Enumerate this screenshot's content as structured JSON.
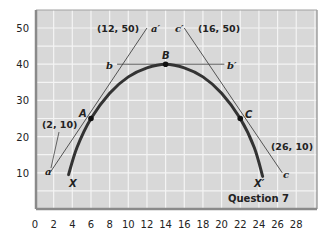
{
  "chart_data": {
    "type": "line",
    "title": "Question 7",
    "xlabel": "",
    "ylabel": "",
    "xlim": [
      0,
      30
    ],
    "ylim": [
      0,
      55
    ],
    "x_ticks": [
      0,
      2,
      4,
      6,
      8,
      10,
      12,
      14,
      16,
      18,
      20,
      22,
      24,
      26,
      28
    ],
    "y_ticks": [
      10,
      20,
      30,
      40,
      50
    ],
    "grid": true,
    "colors": {
      "plot_bg": "#d8d8d8",
      "grid": "#f4f4f4",
      "frame": "#8a8a8a",
      "curve": "#333333",
      "line": "#444444"
    },
    "series": [
      {
        "name": "XX' curve",
        "type": "curve",
        "points": [
          [
            3.6,
            9.5
          ],
          [
            4.5,
            17
          ],
          [
            6,
            25
          ],
          [
            8,
            32
          ],
          [
            10,
            36.5
          ],
          [
            12,
            39
          ],
          [
            14,
            40
          ],
          [
            16,
            39
          ],
          [
            18,
            36.5
          ],
          [
            20,
            32
          ],
          [
            22,
            25
          ],
          [
            23.5,
            17
          ],
          [
            24.4,
            9
          ]
        ],
        "start_label": "X",
        "end_label": "X'"
      },
      {
        "name": "aa' tangent at A",
        "type": "line",
        "points": [
          [
            1.6,
            10
          ],
          [
            12,
            50
          ]
        ],
        "start_label": "a",
        "end_label": "a'"
      },
      {
        "name": "bb' tangent at B",
        "type": "line",
        "points": [
          [
            8.8,
            40
          ],
          [
            20.3,
            40
          ]
        ],
        "start_label": "b",
        "end_label": "b'"
      },
      {
        "name": "cc' tangent at C",
        "type": "line",
        "points": [
          [
            16,
            50
          ],
          [
            26.5,
            10
          ]
        ],
        "start_label": "c'",
        "end_label": "c"
      }
    ],
    "points": [
      {
        "label": "A",
        "x": 6,
        "y": 25
      },
      {
        "label": "B",
        "x": 14,
        "y": 40
      },
      {
        "label": "C",
        "x": 22,
        "y": 25
      }
    ],
    "annotations": [
      {
        "text": "(12, 50)",
        "x": 8,
        "y": 50
      },
      {
        "text": "(16, 50)",
        "x": 19.5,
        "y": 50
      },
      {
        "text": "(2, 10)",
        "x": 2.5,
        "y": 20
      },
      {
        "text": "(26, 10)",
        "x": 26.5,
        "y": 15
      }
    ]
  },
  "labels": {
    "title": "Question 7",
    "ann_12_50": "(12, 50)",
    "ann_16_50": "(16, 50)",
    "ann_2_10": "(2, 10)",
    "ann_26_10": "(26, 10)",
    "a": "a",
    "a_prime": "a′",
    "b": "b",
    "b_prime": "b′",
    "c": "c",
    "c_prime": "c′",
    "A": "A",
    "B": "B",
    "C": "C",
    "X": "X",
    "X_prime": "X′"
  }
}
